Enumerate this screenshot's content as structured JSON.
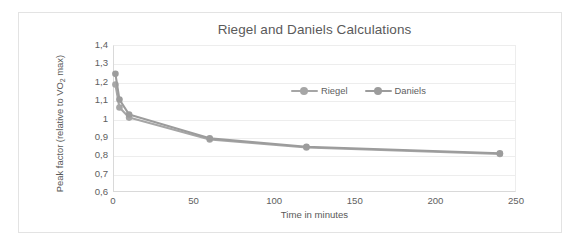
{
  "chart_data": {
    "type": "line",
    "title": "Riegel and Daniels Calculations",
    "xlabel": "Time in minutes",
    "ylabel": "Peak factor (relative to VO2 max)",
    "ylabel_prefix": "Peak factor (relative to VO",
    "ylabel_sub": "2",
    "ylabel_suffix": " max)",
    "xlim": [
      0,
      250
    ],
    "ylim": [
      0.6,
      1.4
    ],
    "grid": true,
    "legend_position": "inside-top-center",
    "x_tick_labels": [
      "0",
      "50",
      "100",
      "150",
      "200",
      "250"
    ],
    "x_ticks": [
      0,
      50,
      100,
      150,
      200,
      250
    ],
    "y_tick_labels": [
      "1,4",
      "1,3",
      "1,2",
      "1,1",
      "1",
      "0,9",
      "0,8",
      "0,7",
      "0,6"
    ],
    "y_ticks": [
      1.4,
      1.3,
      1.2,
      1.1,
      1.0,
      0.9,
      0.8,
      0.7,
      0.6
    ],
    "x": [
      1.5,
      4,
      10,
      60,
      120,
      240
    ],
    "series": [
      {
        "name": "Riegel",
        "color": "#a6a6a6",
        "values": [
          1.185,
          1.06,
          1.005,
          0.886,
          0.842,
          0.807
        ]
      },
      {
        "name": "Daniels",
        "color": "#9c9c9c",
        "values": [
          1.243,
          1.103,
          1.022,
          0.892,
          0.846,
          0.811
        ]
      }
    ]
  },
  "legend": {
    "entries": [
      {
        "label": "Riegel",
        "color": "#a6a6a6"
      },
      {
        "label": "Daniels",
        "color": "#9c9c9c"
      }
    ]
  },
  "colors": {
    "grid": "#ededed",
    "axis": "#d9d9d9",
    "text": "#606060",
    "title": "#5a5a5a",
    "frame": "#e3e3e3",
    "series_riegel": "#a6a6a6",
    "series_daniels": "#9c9c9c"
  }
}
